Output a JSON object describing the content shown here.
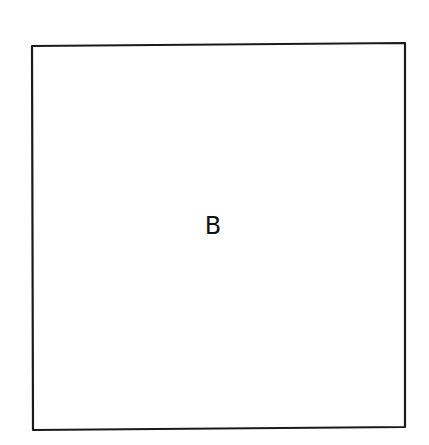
{
  "diagram": {
    "shape": "square",
    "label": "B",
    "stroke_color": "#1a1a1a",
    "background": "#ffffff"
  }
}
